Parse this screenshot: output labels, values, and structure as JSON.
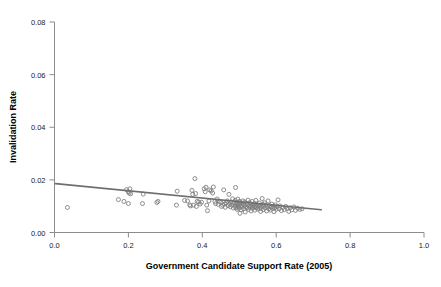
{
  "figure": {
    "cut_off_title": "",
    "background_color": "#ffffff",
    "point_color": "#808080",
    "line_color": "#6e6e6e",
    "axis_color": "#8c8c8c"
  },
  "chart_data": {
    "type": "scatter",
    "title": "",
    "xlabel": "Government Candidate Support Rate (2005)",
    "ylabel": "Invalidation Rate",
    "xlim": [
      0.0,
      1.0
    ],
    "ylim": [
      0.0,
      0.08
    ],
    "xticks": [
      0.0,
      0.2,
      0.4,
      0.6,
      0.8,
      1.0
    ],
    "xticklabels": [
      "0.0",
      "0.2",
      "0.4",
      "0.6",
      "0.8",
      "1.0"
    ],
    "yticks": [
      0.0,
      0.02,
      0.04,
      0.06,
      0.08
    ],
    "yticklabels": [
      "0.00",
      "0.02",
      "0.04",
      "0.06",
      "0.08"
    ],
    "grid": false,
    "legend": null,
    "marker": "open-circle",
    "marker_size": 4,
    "fit_line": {
      "type": "linear-regression",
      "x_start": 0.003,
      "y_start": 0.01855,
      "x_end": 0.722,
      "y_end": 0.00865,
      "slope": -0.01376,
      "intercept": 0.018591
    },
    "n_points": 152,
    "points": [
      [
        0.035,
        0.0095
      ],
      [
        0.173,
        0.0125
      ],
      [
        0.188,
        0.0118
      ],
      [
        0.195,
        0.0163
      ],
      [
        0.2,
        0.0155
      ],
      [
        0.202,
        0.015
      ],
      [
        0.204,
        0.0166
      ],
      [
        0.206,
        0.0147
      ],
      [
        0.2,
        0.011
      ],
      [
        0.238,
        0.011
      ],
      [
        0.24,
        0.0146
      ],
      [
        0.277,
        0.0114
      ],
      [
        0.28,
        0.0118
      ],
      [
        0.33,
        0.0104
      ],
      [
        0.332,
        0.0157
      ],
      [
        0.352,
        0.0122
      ],
      [
        0.36,
        0.012
      ],
      [
        0.366,
        0.0105
      ],
      [
        0.368,
        0.0101
      ],
      [
        0.372,
        0.016
      ],
      [
        0.374,
        0.0145
      ],
      [
        0.376,
        0.0104
      ],
      [
        0.38,
        0.0205
      ],
      [
        0.382,
        0.0148
      ],
      [
        0.384,
        0.0099
      ],
      [
        0.386,
        0.0118
      ],
      [
        0.39,
        0.0116
      ],
      [
        0.394,
        0.0108
      ],
      [
        0.398,
        0.0115
      ],
      [
        0.405,
        0.0166
      ],
      [
        0.408,
        0.0155
      ],
      [
        0.41,
        0.0172
      ],
      [
        0.412,
        0.0104
      ],
      [
        0.414,
        0.0083
      ],
      [
        0.418,
        0.012
      ],
      [
        0.42,
        0.0162
      ],
      [
        0.424,
        0.0158
      ],
      [
        0.428,
        0.015
      ],
      [
        0.43,
        0.0173
      ],
      [
        0.434,
        0.0118
      ],
      [
        0.436,
        0.011
      ],
      [
        0.44,
        0.0127
      ],
      [
        0.443,
        0.0107
      ],
      [
        0.446,
        0.0118
      ],
      [
        0.45,
        0.0114
      ],
      [
        0.452,
        0.0099
      ],
      [
        0.455,
        0.0104
      ],
      [
        0.458,
        0.0162
      ],
      [
        0.46,
        0.0108
      ],
      [
        0.462,
        0.0096
      ],
      [
        0.465,
        0.0113
      ],
      [
        0.468,
        0.012
      ],
      [
        0.47,
        0.0102
      ],
      [
        0.472,
        0.0145
      ],
      [
        0.474,
        0.0108
      ],
      [
        0.476,
        0.0098
      ],
      [
        0.478,
        0.0116
      ],
      [
        0.48,
        0.0105
      ],
      [
        0.482,
        0.0128
      ],
      [
        0.484,
        0.0093
      ],
      [
        0.486,
        0.0112
      ],
      [
        0.488,
        0.01
      ],
      [
        0.489,
        0.0122
      ],
      [
        0.49,
        0.0171
      ],
      [
        0.491,
        0.0094
      ],
      [
        0.492,
        0.0108
      ],
      [
        0.493,
        0.0115
      ],
      [
        0.494,
        0.0088
      ],
      [
        0.495,
        0.0102
      ],
      [
        0.496,
        0.0127
      ],
      [
        0.497,
        0.0098
      ],
      [
        0.498,
        0.011
      ],
      [
        0.499,
        0.0092
      ],
      [
        0.5,
        0.0106
      ],
      [
        0.501,
        0.0118
      ],
      [
        0.502,
        0.0073
      ],
      [
        0.503,
        0.01
      ],
      [
        0.504,
        0.0113
      ],
      [
        0.505,
        0.0086
      ],
      [
        0.506,
        0.0104
      ],
      [
        0.508,
        0.0096
      ],
      [
        0.51,
        0.012
      ],
      [
        0.511,
        0.0108
      ],
      [
        0.512,
        0.009
      ],
      [
        0.514,
        0.0102
      ],
      [
        0.515,
        0.0116
      ],
      [
        0.516,
        0.0078
      ],
      [
        0.518,
        0.0098
      ],
      [
        0.52,
        0.011
      ],
      [
        0.521,
        0.0094
      ],
      [
        0.522,
        0.0105
      ],
      [
        0.524,
        0.0123
      ],
      [
        0.525,
        0.0088
      ],
      [
        0.526,
        0.01
      ],
      [
        0.528,
        0.0113
      ],
      [
        0.53,
        0.0096
      ],
      [
        0.531,
        0.0107
      ],
      [
        0.532,
        0.0082
      ],
      [
        0.534,
        0.0101
      ],
      [
        0.535,
        0.0118
      ],
      [
        0.536,
        0.0092
      ],
      [
        0.538,
        0.0104
      ],
      [
        0.54,
        0.0097
      ],
      [
        0.541,
        0.011
      ],
      [
        0.542,
        0.0085
      ],
      [
        0.544,
        0.01
      ],
      [
        0.545,
        0.0122
      ],
      [
        0.546,
        0.0094
      ],
      [
        0.548,
        0.0106
      ],
      [
        0.55,
        0.0089
      ],
      [
        0.552,
        0.0099
      ],
      [
        0.554,
        0.0112
      ],
      [
        0.555,
        0.0091
      ],
      [
        0.556,
        0.0103
      ],
      [
        0.558,
        0.008
      ],
      [
        0.56,
        0.0096
      ],
      [
        0.562,
        0.0129
      ],
      [
        0.564,
        0.0107
      ],
      [
        0.565,
        0.0087
      ],
      [
        0.566,
        0.01
      ],
      [
        0.568,
        0.0113
      ],
      [
        0.57,
        0.0093
      ],
      [
        0.572,
        0.0104
      ],
      [
        0.574,
        0.0082
      ],
      [
        0.576,
        0.0098
      ],
      [
        0.578,
        0.012
      ],
      [
        0.58,
        0.009
      ],
      [
        0.582,
        0.0102
      ],
      [
        0.584,
        0.0085
      ],
      [
        0.586,
        0.0096
      ],
      [
        0.588,
        0.0108
      ],
      [
        0.59,
        0.0092
      ],
      [
        0.592,
        0.01
      ],
      [
        0.594,
        0.0079
      ],
      [
        0.596,
        0.0094
      ],
      [
        0.598,
        0.0105
      ],
      [
        0.6,
        0.0088
      ],
      [
        0.602,
        0.0098
      ],
      [
        0.605,
        0.0124
      ],
      [
        0.608,
        0.009
      ],
      [
        0.61,
        0.0101
      ],
      [
        0.614,
        0.0083
      ],
      [
        0.618,
        0.0095
      ],
      [
        0.622,
        0.0087
      ],
      [
        0.626,
        0.0099
      ],
      [
        0.63,
        0.0091
      ],
      [
        0.634,
        0.008
      ],
      [
        0.638,
        0.0094
      ],
      [
        0.642,
        0.0086
      ],
      [
        0.648,
        0.0097
      ],
      [
        0.652,
        0.0084
      ],
      [
        0.658,
        0.0092
      ],
      [
        0.664,
        0.0088
      ],
      [
        0.67,
        0.009
      ]
    ]
  }
}
